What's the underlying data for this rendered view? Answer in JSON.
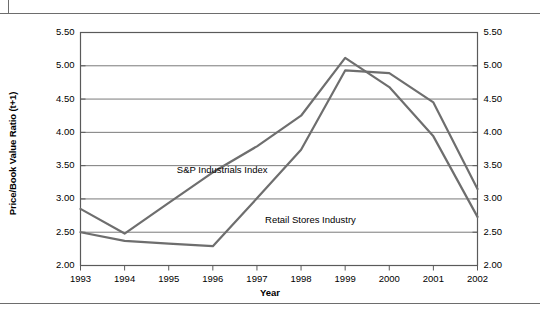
{
  "figure": {
    "rules": [
      "top-rule",
      "bottom-rule"
    ]
  },
  "chart_data": {
    "type": "line",
    "title": "",
    "xlabel": "Year",
    "ylabel": "Price/Book Value Ratio (t+1)",
    "ylabel_right": "Price/Book Value Ratio (t+1)",
    "x": [
      1993,
      1994,
      1995,
      1996,
      1997,
      1998,
      1999,
      2000,
      2001,
      2002
    ],
    "categories": [
      "1993",
      "1994",
      "1995",
      "1996",
      "1997",
      "1998",
      "1999",
      "2000",
      "2001",
      "2002"
    ],
    "xtick_labels": [
      "1993",
      "1994",
      "1995",
      "1996",
      "1997",
      "1998",
      "1999",
      "2000",
      "2001",
      "2002"
    ],
    "ytick_labels": [
      "2.00",
      "2.50",
      "3.00",
      "3.50",
      "4.00",
      "4.50",
      "5.00",
      "5.50"
    ],
    "ytick_labels_right": [
      "2.00",
      "2.50",
      "3.00",
      "3.50",
      "4.00",
      "4.50",
      "5.00",
      "5.50"
    ],
    "yticks": [
      2.0,
      2.5,
      3.0,
      3.5,
      4.0,
      4.5,
      5.0,
      5.5
    ],
    "ylim": [
      2.0,
      5.5
    ],
    "xlim": [
      1993,
      2002
    ],
    "grid": "horizontal",
    "legend": "inline-annotations",
    "series": [
      {
        "name": "S&P Industrials Index",
        "color": "#6e6e6e",
        "values": [
          2.85,
          2.48,
          2.94,
          3.4,
          3.79,
          4.25,
          5.12,
          4.68,
          3.94,
          2.73
        ],
        "label_x": 1997,
        "label_y": 3.42
      },
      {
        "name": "Retail Stores Industry",
        "color": "#6e6e6e",
        "values": [
          2.5,
          2.37,
          2.33,
          2.29,
          3.01,
          3.74,
          4.93,
          4.89,
          4.45,
          3.15
        ],
        "label_x": 1999,
        "label_y": 2.68
      }
    ],
    "annotations": [
      {
        "text": "S&P Industrials Index",
        "x": 1996,
        "y": 3.42
      },
      {
        "text": "Retail Stores Industry",
        "x": 1998,
        "y": 2.68
      }
    ],
    "axis_color": "#5a5a5a",
    "grid_color": "#7a7a7a",
    "line_width": 2.2
  }
}
